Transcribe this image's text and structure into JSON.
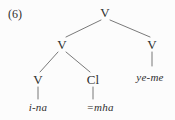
{
  "figure": {
    "example_number": "(6)",
    "background_color": "#fcfcfc",
    "text_color": "#2f2f2f",
    "line_color": "#6a6a6a"
  },
  "tree": {
    "type": "syntax-tree",
    "nodes": [
      {
        "id": "root",
        "label": "V",
        "x": 105,
        "y": 12,
        "kind": "category"
      },
      {
        "id": "v-mid",
        "label": "V",
        "x": 62,
        "y": 44,
        "kind": "category"
      },
      {
        "id": "v-right",
        "label": "V",
        "x": 152,
        "y": 44,
        "kind": "category"
      },
      {
        "id": "v-inner",
        "label": "V",
        "x": 38,
        "y": 79,
        "kind": "category"
      },
      {
        "id": "cl",
        "label": "Cl",
        "x": 93,
        "y": 79,
        "kind": "category"
      }
    ],
    "leaves": [
      {
        "id": "leaf-ina",
        "label": "i-na",
        "x": 38,
        "y": 107,
        "parent": "v-inner"
      },
      {
        "id": "leaf-mha",
        "label": "=mha",
        "x": 100,
        "y": 107,
        "parent": "cl"
      },
      {
        "id": "leaf-yeme",
        "label": "ye-me",
        "x": 150,
        "y": 77,
        "parent": "v-right"
      }
    ],
    "edges": [
      {
        "from": "root",
        "to": "v-mid",
        "x1": 101,
        "y1": 20,
        "x2": 66,
        "y2": 37
      },
      {
        "from": "root",
        "to": "v-right",
        "x1": 110,
        "y1": 20,
        "x2": 150,
        "y2": 37
      },
      {
        "from": "v-mid",
        "to": "v-inner",
        "x1": 58,
        "y1": 52,
        "x2": 40,
        "y2": 72
      },
      {
        "from": "v-mid",
        "to": "cl",
        "x1": 66,
        "y1": 52,
        "x2": 90,
        "y2": 72
      },
      {
        "from": "v-right",
        "to": "leaf-yeme",
        "x1": 152,
        "y1": 52,
        "x2": 152,
        "y2": 66
      },
      {
        "from": "v-inner",
        "to": "leaf-ina",
        "x1": 38,
        "y1": 87,
        "x2": 38,
        "y2": 99
      },
      {
        "from": "cl",
        "to": "leaf-mha",
        "x1": 93,
        "y1": 87,
        "x2": 93,
        "y2": 99
      }
    ]
  }
}
